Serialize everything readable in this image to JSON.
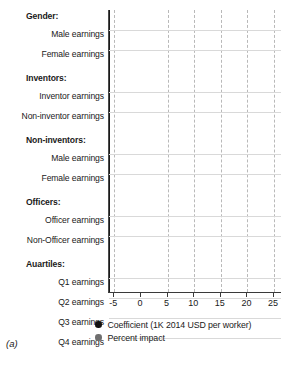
{
  "panel_label": "(a)",
  "legend": [
    {
      "key": "coefficient",
      "label": "Coefficient (1K 2014 USD per worker)",
      "color": "#111111"
    },
    {
      "key": "percent",
      "label": "Percent impact",
      "color": "#6f6f6f"
    }
  ],
  "axis": {
    "ticks": [
      "-5",
      "0",
      "5",
      "10",
      "15",
      "20",
      "25"
    ],
    "min": -6.0,
    "max": 26.5
  },
  "groups": [
    {
      "name": "Gender:",
      "rows": [
        "Male earnings",
        "Female earnings"
      ]
    },
    {
      "name": "Inventors:",
      "rows": [
        "Inventor earnings",
        "Non-inventor earnings"
      ]
    },
    {
      "name": "Non-inventors:",
      "rows": [
        "Male earnings",
        "Female earnings"
      ]
    },
    {
      "name": "Officers:",
      "rows": [
        "Officer earnings",
        "Non-Officer earnings"
      ]
    },
    {
      "name": "Auartiles:",
      "rows": [
        "Q1 earnings",
        "Q2 earnings",
        "Q3 earnings",
        "Q4 earnings"
      ]
    }
  ],
  "chart_data": {
    "type": "scatter",
    "title": "",
    "xlabel": "",
    "ylabel": "",
    "xlim": [
      -6.0,
      26.5
    ],
    "grid": true,
    "legend_position": "bottom",
    "xticks": [
      -5,
      0,
      5,
      10,
      15,
      20,
      25
    ],
    "series": [
      {
        "name": "Coefficient (1K 2014 USD per worker)",
        "color": "#111111"
      },
      {
        "name": "Percent impact",
        "color": "#6f6f6f"
      }
    ],
    "categories": [
      "Gender: Male earnings",
      "Gender: Female earnings",
      "Inventors: Inventor earnings",
      "Inventors: Non-inventor earnings",
      "Non-inventors: Male earnings",
      "Non-inventors: Female earnings",
      "Officers: Officer earnings",
      "Officers: Non-Officer earnings",
      "Auartiles: Q1 earnings",
      "Auartiles: Q2 earnings",
      "Auartiles: Q3 earnings",
      "Auartiles: Q4 earnings"
    ],
    "points": [
      {
        "category": "Gender: Male earnings",
        "series": "Coefficient (1K 2014 USD per worker)",
        "value": 5.8,
        "ci_low": 1.7,
        "ci_high": 11.0
      },
      {
        "category": "Gender: Male earnings",
        "series": "Percent impact",
        "value": 8.2,
        "ci_low": 2.6,
        "ci_high": 18.7
      },
      {
        "category": "Gender: Female earnings",
        "series": "Coefficient (1K 2014 USD per worker)",
        "value": 0.1,
        "ci_low": -2.8,
        "ci_high": 3.2
      },
      {
        "category": "Gender: Female earnings",
        "series": "Percent impact",
        "value": 0.3,
        "ci_low": -3.4,
        "ci_high": 7.5
      },
      {
        "category": "Inventors: Inventor earnings",
        "series": "Coefficient (1K 2014 USD per worker)",
        "value": 16.1,
        "ci_low": 0.1,
        "ci_high": 26.5
      },
      {
        "category": "Inventors: Inventor earnings",
        "series": "Percent impact",
        "value": 11.4,
        "ci_low": 0.1,
        "ci_high": 22.6
      },
      {
        "category": "Inventors: Non-inventor earnings",
        "series": "Coefficient (1K 2014 USD per worker)",
        "value": 2.6,
        "ci_low": -0.9,
        "ci_high": 5.6
      },
      {
        "category": "Inventors: Non-inventor earnings",
        "series": "Percent impact",
        "value": 3.7,
        "ci_low": -1.9,
        "ci_high": 8.6
      },
      {
        "category": "Non-inventors: Male earnings",
        "series": "Coefficient (1K 2014 USD per worker)",
        "value": 3.4,
        "ci_low": 0.1,
        "ci_high": 6.2
      },
      {
        "category": "Non-inventors: Male earnings",
        "series": "Percent impact",
        "value": 5.6,
        "ci_low": 0.1,
        "ci_high": 10.9
      },
      {
        "category": "Non-inventors: Female earnings",
        "series": "Coefficient (1K 2014 USD per worker)",
        "value": 0.2,
        "ci_low": -2.4,
        "ci_high": 3.2
      },
      {
        "category": "Non-inventors: Female earnings",
        "series": "Percent impact",
        "value": 0.8,
        "ci_low": 0.1,
        "ci_high": 9.2
      },
      {
        "category": "Officers: Officer earnings",
        "series": "Coefficient (1K 2014 USD per worker)",
        "value": 3.7,
        "ci_low": 0.6,
        "ci_high": 5.6
      },
      {
        "category": "Officers: Officer earnings",
        "series": "Percent impact",
        "value": 22.4,
        "ci_low": 7.1,
        "ci_high": 26.5
      },
      {
        "category": "Officers: Non-Officer earnings",
        "series": "Coefficient (1K 2014 USD per worker)",
        "value": 0.1,
        "ci_low": -3.2,
        "ci_high": 3.6
      },
      {
        "category": "Officers: Non-Officer earnings",
        "series": "Percent impact",
        "value": 0.3,
        "ci_low": -5.0,
        "ci_high": 10.3
      },
      {
        "category": "Auartiles: Q1 earnings",
        "series": "Coefficient (1K 2014 USD per worker)",
        "value": 0.1,
        "ci_low": -2.2,
        "ci_high": 1.7
      },
      {
        "category": "Auartiles: Q1 earnings",
        "series": "Percent impact",
        "value": -0.3,
        "ci_low": -5.2,
        "ci_high": 10.1
      },
      {
        "category": "Auartiles: Q2 earnings",
        "series": "Coefficient (1K 2014 USD per worker)",
        "value": 0.2,
        "ci_low": -3.9,
        "ci_high": 1.3
      },
      {
        "category": "Auartiles: Q2 earnings",
        "series": "Percent impact",
        "value": -1.3,
        "ci_low": -5.2,
        "ci_high": 3.9
      },
      {
        "category": "Auartiles: Q3 earnings",
        "series": "Coefficient (1K 2014 USD per worker)",
        "value": 0.2,
        "ci_low": -2.6,
        "ci_high": 2.6
      },
      {
        "category": "Auartiles: Q3 earnings",
        "series": "Percent impact",
        "value": 0.7,
        "ci_low": -4.9,
        "ci_high": 5.2
      },
      {
        "category": "Auartiles: Q4 earnings",
        "series": "Coefficient (1K 2014 USD per worker)",
        "value": 7.3,
        "ci_low": 1.9,
        "ci_high": 12.7
      },
      {
        "category": "Auartiles: Q4 earnings",
        "series": "Percent impact",
        "value": 8.0,
        "ci_low": 1.3,
        "ci_high": 10.7
      }
    ]
  }
}
